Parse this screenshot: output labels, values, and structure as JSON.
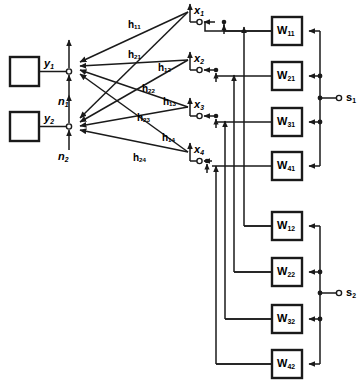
{
  "diagram": {
    "colors": {
      "line": "#1a1a1a",
      "box_stroke": "#000000",
      "background": "#ffffff"
    },
    "sources": [
      {
        "name": "source-block-1",
        "signal": "y",
        "signal_sub": "1",
        "noise": "n",
        "noise_sub": "1"
      },
      {
        "name": "source-block-2",
        "signal": "y",
        "signal_sub": "2",
        "noise": "n",
        "noise_sub": "2"
      }
    ],
    "channel_gains": [
      {
        "id": "h11",
        "base": "h",
        "sub": "11"
      },
      {
        "id": "h21",
        "base": "h",
        "sub": "21"
      },
      {
        "id": "h12",
        "base": "h",
        "sub": "12"
      },
      {
        "id": "h22",
        "base": "h",
        "sub": "22"
      },
      {
        "id": "h13",
        "base": "h",
        "sub": "13"
      },
      {
        "id": "h23",
        "base": "h",
        "sub": "23"
      },
      {
        "id": "h14",
        "base": "h",
        "sub": "14"
      },
      {
        "id": "h24",
        "base": "h",
        "sub": "24"
      }
    ],
    "receive_nodes": [
      {
        "id": "x1",
        "base": "x",
        "sub": "1"
      },
      {
        "id": "x2",
        "base": "x",
        "sub": "2"
      },
      {
        "id": "x3",
        "base": "x",
        "sub": "3"
      },
      {
        "id": "x4",
        "base": "x",
        "sub": "4"
      }
    ],
    "weight_blocks_column_1": [
      {
        "id": "W11",
        "base": "W",
        "sub": "11"
      },
      {
        "id": "W21",
        "base": "W",
        "sub": "21"
      },
      {
        "id": "W31",
        "base": "W",
        "sub": "31"
      },
      {
        "id": "W41",
        "base": "W",
        "sub": "41"
      }
    ],
    "weight_blocks_column_2": [
      {
        "id": "W12",
        "base": "W",
        "sub": "12"
      },
      {
        "id": "W22",
        "base": "W",
        "sub": "22"
      },
      {
        "id": "W32",
        "base": "W",
        "sub": "32"
      },
      {
        "id": "W42",
        "base": "W",
        "sub": "42"
      }
    ],
    "outputs": [
      {
        "id": "s1",
        "base": "s",
        "sub": "1"
      },
      {
        "id": "s2",
        "base": "s",
        "sub": "2"
      }
    ]
  }
}
